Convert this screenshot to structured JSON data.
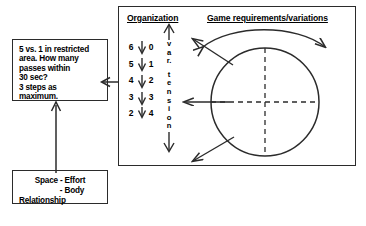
{
  "diagram": {
    "task_box": {
      "lines": [
        "5 vs. 1 in restricted",
        "area. How many",
        "passes within",
        "30 sec?",
        "3 steps as",
        "maximum."
      ]
    },
    "relationship_box": {
      "lines": [
        "Space  -  Effort",
        "-  Body",
        "Relationship"
      ]
    },
    "main_frame": {
      "organization": {
        "title": "Organization",
        "digits_left": [
          "6",
          "5",
          "4",
          "3",
          "2"
        ],
        "digits_right": [
          "0",
          "1",
          "2",
          "3",
          "4"
        ],
        "vertical_label_1": "v a r .",
        "vertical_label_2": "t e n s i o n",
        "vertical_label_1_chars": [
          "v",
          "a",
          "r."
        ],
        "vertical_label_2_chars": [
          "t",
          "e",
          "n",
          "s",
          "i",
          "o",
          "n"
        ]
      },
      "game": {
        "title": "Game requirements/variations"
      }
    },
    "colors": {
      "ink": "#2b2b2b",
      "background": "#ffffff"
    }
  }
}
